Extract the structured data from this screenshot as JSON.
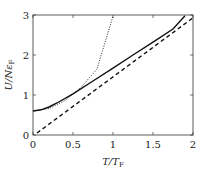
{
  "chart_data": {
    "type": "line",
    "title": "",
    "xlabel": "T/T_F",
    "ylabel": "U/Nε_F",
    "xlim": [
      0,
      2
    ],
    "ylim": [
      0,
      3
    ],
    "xticks": [
      "0",
      "0.5",
      "1",
      "1.5",
      "2"
    ],
    "yticks": [
      "0",
      "1",
      "2",
      "3"
    ],
    "grid": false,
    "series": [
      {
        "name": "exact",
        "style": "solid",
        "x": [
          0,
          0.1,
          0.2,
          0.3,
          0.5,
          0.75,
          1,
          1.25,
          1.5,
          1.75,
          1.9
        ],
        "y": [
          0.6,
          0.63,
          0.7,
          0.8,
          1.03,
          1.35,
          1.67,
          2.0,
          2.32,
          2.65,
          2.98
        ]
      },
      {
        "name": "low-T expansion",
        "style": "dotted",
        "x": [
          0,
          0.2,
          0.4,
          0.6,
          0.8,
          1.0
        ],
        "y": [
          0.6,
          0.66,
          0.86,
          1.19,
          1.65,
          2.97
        ]
      },
      {
        "name": "classical",
        "style": "dashed",
        "x": [
          0.05,
          2
        ],
        "y": [
          0.05,
          2.93
        ]
      }
    ]
  }
}
